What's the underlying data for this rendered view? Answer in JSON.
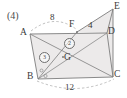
{
  "figure": {
    "problem_number": "(4)",
    "type": "geometry-diagram",
    "colors": {
      "stroke": "#7d7d7d",
      "fill": "#eceaea",
      "text": "#3a3a3a",
      "dashed": "#9a9a9a"
    },
    "vertices": [
      {
        "name": "A",
        "label": "A",
        "x": 30,
        "y": 34,
        "label_x": 21,
        "label_y": 29
      },
      {
        "name": "B",
        "label": "B",
        "x": 38,
        "y": 79,
        "label_x": 28,
        "label_y": 73
      },
      {
        "name": "C",
        "label": "C",
        "x": 113,
        "y": 77,
        "label_x": 115,
        "label_y": 71
      },
      {
        "name": "D",
        "label": "D",
        "x": 107,
        "y": 33,
        "label_x": 108,
        "label_y": 28
      },
      {
        "name": "E",
        "label": "E",
        "x": 113,
        "y": 9,
        "label_x": 115,
        "label_y": 3
      },
      {
        "name": "F",
        "label": "F",
        "x": 77,
        "y": 32,
        "label_x": 69,
        "label_y": 21
      },
      {
        "name": "G",
        "label": "G",
        "x": 63,
        "y": 57,
        "label_x": 64,
        "label_y": 55
      }
    ],
    "dimensions": [
      {
        "name": "AF",
        "label": "8",
        "label_x": 48,
        "label_y": 18,
        "style": "dashed-arc"
      },
      {
        "name": "FD",
        "label": "4",
        "label_x": 90,
        "label_y": 23,
        "style": "plain"
      },
      {
        "name": "BC",
        "label": "12",
        "label_x": 69,
        "label_y": 87,
        "style": "dashed-arc"
      }
    ],
    "area_marks": [
      {
        "name": "region-2",
        "label": "2",
        "label_x": 69,
        "label_y": 41
      },
      {
        "name": "region-3",
        "label": "3",
        "label_x": 43,
        "label_y": 55
      }
    ],
    "angle_marks": [
      {
        "name": "angle-mark-b-upper",
        "x": 41,
        "y": 70
      },
      {
        "name": "angle-mark-b-lower",
        "x": 45,
        "y": 76
      }
    ]
  }
}
